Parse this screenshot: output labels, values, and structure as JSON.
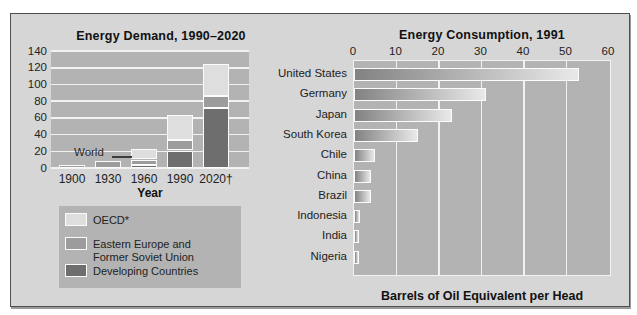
{
  "colors": {
    "figure_bg": "#d6d6d6",
    "figure_border": "#4f4f4f",
    "plot_bg": "#b3b3b3",
    "grid": "#f2f2f2",
    "segment_border": "#fbfbfb",
    "oecd": "#dedede",
    "eefsu": "#9c9c9c",
    "developing": "#6e6e6e",
    "hbar_start": "#828282",
    "hbar_end": "#e9e9e9",
    "text": "#1c1c1c"
  },
  "chart_data": [
    {
      "type": "bar",
      "stacked": true,
      "title": "Energy Demand, 1990–2020",
      "xlabel": "Year",
      "ylim": [
        0,
        140
      ],
      "yticks": [
        140,
        120,
        100,
        80,
        60,
        40,
        20,
        0
      ],
      "grid": "horizontal white lines on gray plot",
      "categories": [
        "1900",
        "1930",
        "1960",
        "1990",
        "2020†"
      ],
      "annotation": {
        "text": "World"
      },
      "series": [
        {
          "name": "Developing Countries",
          "key": "developing",
          "values": [
            0,
            0,
            4,
            21,
            72
          ]
        },
        {
          "name": "Eastern Europe and Former Soviet Union",
          "key": "eefsu",
          "values": [
            3,
            8,
            6,
            13,
            14
          ]
        },
        {
          "name": "OECD*",
          "key": "oecd",
          "values": [
            0,
            0,
            13,
            30,
            38
          ]
        }
      ],
      "totals": [
        3,
        8,
        23,
        64,
        124
      ],
      "legend": [
        {
          "series": "oecd",
          "label": "OECD*"
        },
        {
          "series": "eefsu",
          "label": "Eastern Europe and",
          "label2": "Former Soviet Union"
        },
        {
          "series": "developing",
          "label": "Developing Countries"
        }
      ],
      "legend_position": "below"
    },
    {
      "type": "bar",
      "orientation": "horizontal",
      "title": "Energy Consumption, 1991",
      "xlabel": "Barrels of Oil Equivalent per Head",
      "xlim": [
        0,
        60
      ],
      "xticks": [
        0,
        10,
        20,
        30,
        40,
        50,
        60
      ],
      "grid": "vertical white lines on gray plot",
      "categories": [
        "United States",
        "Germany",
        "Japan",
        "South Korea",
        "Chile",
        "China",
        "Brazil",
        "Indonesia",
        "India",
        "Nigeria"
      ],
      "values": [
        53,
        31,
        23,
        15,
        5,
        4,
        4,
        1.5,
        1.2,
        0.7
      ],
      "bar_style": "gradient dark-left to light-right, white outline"
    }
  ]
}
